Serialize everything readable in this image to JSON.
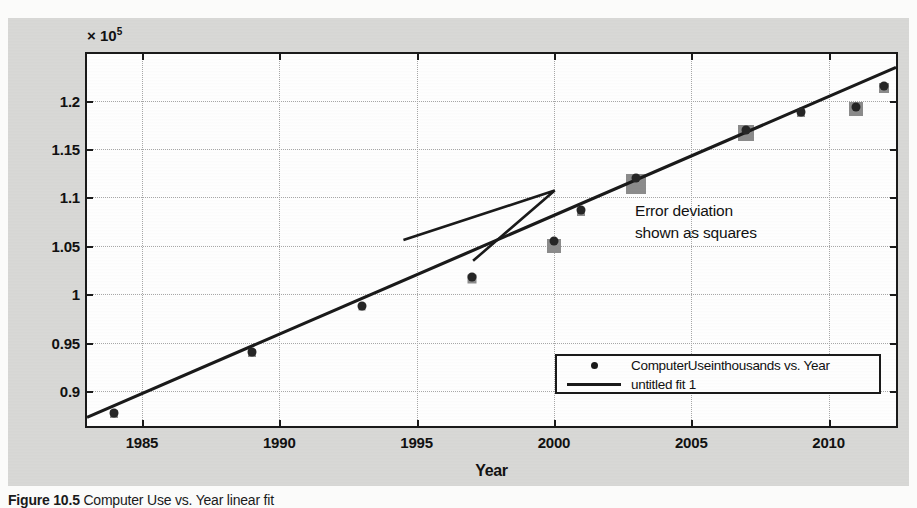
{
  "figure": {
    "exponent_label": "× 10",
    "exponent_power": "5",
    "caption_bold": "Figure 10.5",
    "caption_rest": " Computer Use vs. Year linear fit"
  },
  "annotation": {
    "line1": "Error deviation",
    "line2": "shown as squares"
  },
  "legend": {
    "entries": [
      {
        "label": "ComputerUseinthousands vs. Year",
        "key": "dot-marker"
      },
      {
        "label": "untitled fit 1",
        "key": "line-marker"
      }
    ]
  },
  "colors": {
    "figure_background": "#d9d9d7",
    "plot_background": "#ffffff",
    "axis": "#1a1a1a",
    "grid": "#a8a8a8",
    "marker": "#262626",
    "error_square": "#8c8c8c",
    "fit_line": "#1a1a1a"
  },
  "chart_data": {
    "type": "scatter",
    "title": "",
    "xlabel": "Year",
    "ylabel": "ComputerUseinthousands",
    "y_exponent": 5,
    "xlim": [
      1983.0,
      2012.6
    ],
    "ylim": [
      86000,
      124800
    ],
    "grid": true,
    "legend_position": "lower right",
    "xticks": [
      1985,
      1990,
      1995,
      2000,
      2005,
      2010
    ],
    "xticklabels": [
      "1985",
      "1990",
      "1995",
      "2000",
      "2005",
      "2010"
    ],
    "yticks": [
      90000,
      95000,
      100000,
      105000,
      110000,
      115000,
      120000
    ],
    "yticklabels": [
      "0.9",
      "0.95",
      "1",
      "1.05",
      "1.1",
      "1.15",
      "1.2"
    ],
    "series": [
      {
        "name": "ComputerUseinthousands vs. Year",
        "type": "scatter",
        "marker": "dot",
        "x": [
          1984,
          1989,
          1993,
          1997,
          2000,
          2001,
          2003,
          2007,
          2009,
          2011,
          2012
        ],
        "y": [
          87800,
          94000,
          98800,
          101800,
          105500,
          108700,
          112000,
          117000,
          118800,
          119300,
          121500
        ]
      },
      {
        "name": "Error deviation shown as squares",
        "type": "scatter",
        "marker": "square",
        "x": [
          1984,
          1989,
          1993,
          1997,
          2000,
          2001,
          2003,
          2007,
          2009,
          2011,
          2012
        ],
        "y": [
          87650,
          93900,
          98700,
          101600,
          105000,
          108500,
          111400,
          116600,
          118700,
          119100,
          121300
        ],
        "sizes": [
          8,
          8,
          7,
          9,
          14,
          8,
          20,
          16,
          8,
          14,
          10
        ]
      },
      {
        "name": "untitled fit 1",
        "type": "line",
        "fit": "linear",
        "x": [
          1983.0,
          2012.6
        ],
        "y": [
          86900,
          123400
        ]
      }
    ]
  }
}
